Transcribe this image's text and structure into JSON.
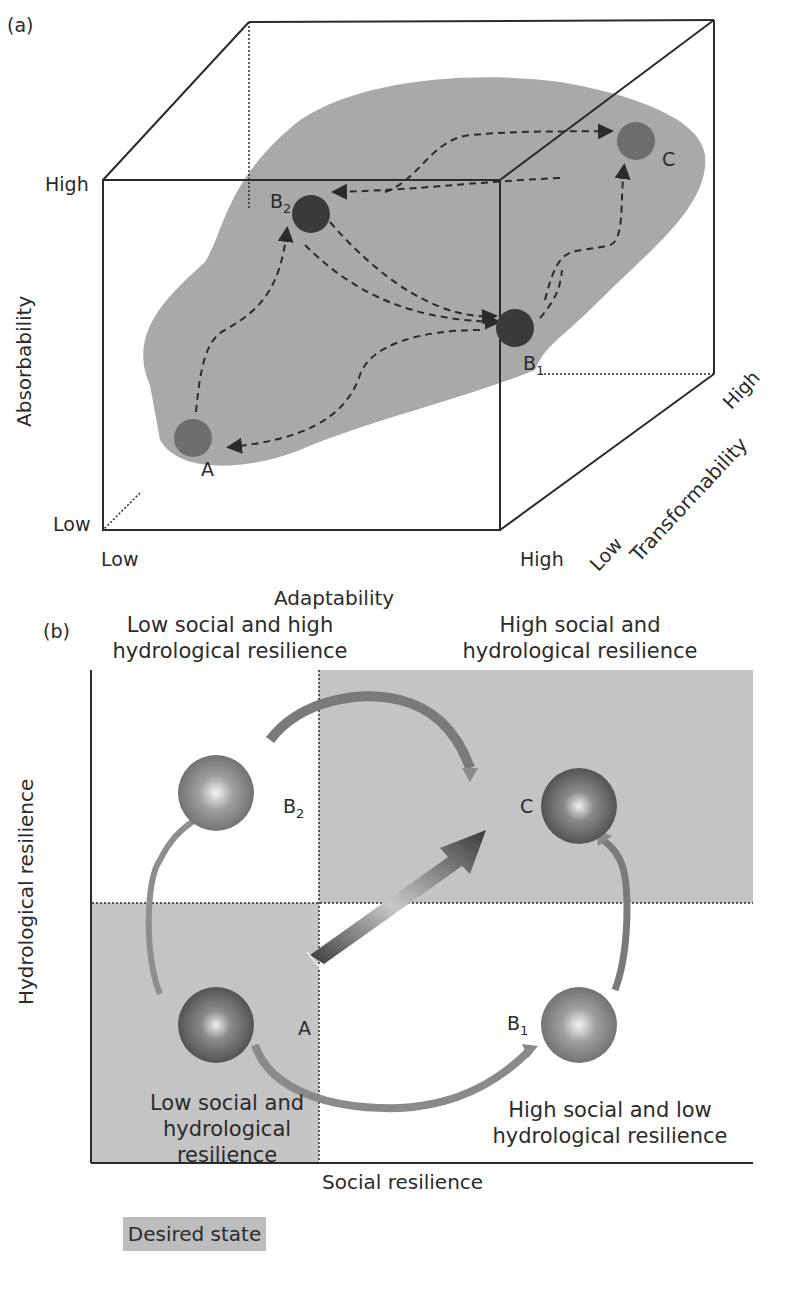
{
  "panel_a": {
    "label": "(a)",
    "axes": {
      "y_title": "Absorbability",
      "y_high": "High",
      "y_low": "Low",
      "x_title": "Adaptability",
      "x_low": "Low",
      "x_high": "High",
      "z_title": "Transformability",
      "z_low": "Low",
      "z_high": "High"
    },
    "states": [
      {
        "id": "A",
        "label": "A",
        "sub": ""
      },
      {
        "id": "B1",
        "label": "B",
        "sub": "1"
      },
      {
        "id": "B2",
        "label": "B",
        "sub": "2"
      },
      {
        "id": "C",
        "label": "C",
        "sub": ""
      }
    ],
    "colors": {
      "blob": "#a9a9a9",
      "dark_state": "#3a3a3a",
      "mid_state": "#6e6e6e",
      "lines": "#2b2b2b"
    }
  },
  "panel_b": {
    "label": "(b)",
    "quadrants": {
      "top_left": "Low social and high\nhydrological resilience",
      "top_left_line1": "Low social and high",
      "top_left_line2": "hydrological resilience",
      "top_right_line1": "High social and",
      "top_right_line2": "hydrological resilience",
      "bottom_left_line1": "Low social and",
      "bottom_left_line2": "hydrological resilience",
      "bottom_right_line1": "High social and low",
      "bottom_right_line2": "hydrological resilience"
    },
    "x_title": "Social resilience",
    "y_title": "Hydrological resilience",
    "states": [
      {
        "id": "A",
        "label": "A",
        "sub": ""
      },
      {
        "id": "B1",
        "label": "B",
        "sub": "1"
      },
      {
        "id": "B2",
        "label": "B",
        "sub": "2"
      },
      {
        "id": "C",
        "label": "C",
        "sub": ""
      }
    ],
    "colors": {
      "shaded_quadrant": "#c4c4c4",
      "state_changing_arrow": "#9a9a9a",
      "management_arrow": "#3d3d3d"
    }
  },
  "legend": {
    "boxes": [
      "Desired state",
      "Undesired state",
      "Transitioning state"
    ],
    "arrows": [
      {
        "label": "State changing path",
        "color": "#a8a8a8"
      },
      {
        "label": "Management target",
        "color": "#3a3a3a"
      }
    ]
  }
}
